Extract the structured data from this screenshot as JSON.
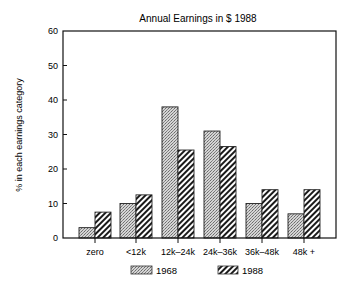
{
  "chart_data": {
    "type": "bar",
    "title": "Annual Earnings in $ 1988",
    "xlabel": "",
    "ylabel": "% in each earnings category",
    "ylim": [
      0,
      60
    ],
    "yticks": [
      0,
      10,
      20,
      30,
      40,
      50,
      60
    ],
    "grid": false,
    "legend_position": "bottom",
    "categories": [
      "zero",
      "<12k",
      "12k–24k",
      "24k–36k",
      "36k–48k",
      "48k +"
    ],
    "series": [
      {
        "name": "1968",
        "pattern": "stippled",
        "color": "#bdbdbd",
        "values": [
          3,
          10,
          38,
          31,
          10,
          7
        ]
      },
      {
        "name": "1988",
        "pattern": "diagonal-hatch",
        "color": "#222222",
        "values": [
          7.5,
          12.5,
          25.5,
          26.5,
          14,
          14
        ]
      }
    ]
  },
  "labels": {
    "title": "Annual Earnings in $ 1988",
    "ylabel": "% in each earnings category",
    "legend_1968": "1968",
    "legend_1988": "1988"
  }
}
